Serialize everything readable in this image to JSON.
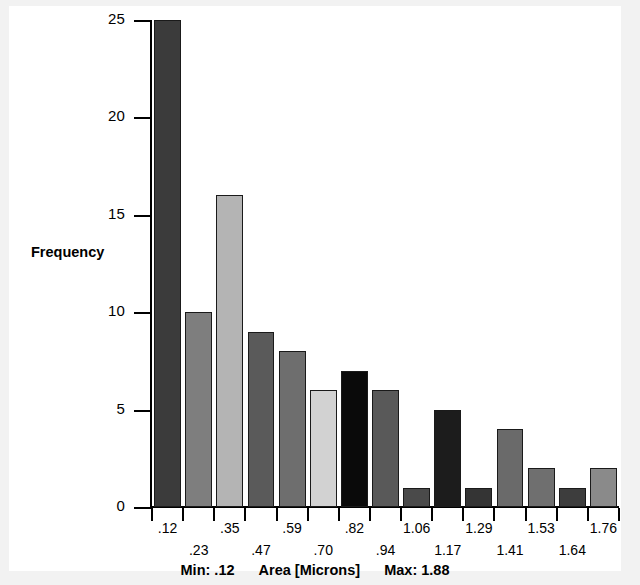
{
  "chart_data": {
    "type": "bar",
    "title": "",
    "subtitle": "",
    "xlabel": "Area [Microns]",
    "ylabel": "Frequency",
    "categories": [
      ".12",
      ".23",
      ".35",
      ".47",
      ".59",
      ".70",
      ".82",
      ".94",
      "1.06",
      "1.17",
      "1.29",
      "1.41",
      "1.53",
      "1.64",
      "1.76"
    ],
    "values": [
      25,
      10,
      16,
      9,
      8,
      6,
      7,
      6,
      1,
      5,
      1,
      4,
      2,
      1,
      2
    ],
    "bar_colors": [
      "#3b3b3b",
      "#7e7e7e",
      "#b4b4b4",
      "#5a5a5a",
      "#6e6e6e",
      "#d2d2d2",
      "#0a0a0a",
      "#595959",
      "#4a4a4a",
      "#1c1c1c",
      "#343434",
      "#6a6a6a",
      "#6f6f6f",
      "#3d3d3d",
      "#8a8a8a"
    ],
    "ylim": [
      0,
      25
    ],
    "yticks": [
      0,
      5,
      10,
      15,
      20,
      25
    ],
    "ytick_labels": [
      "0",
      "5",
      "10",
      "15",
      "20",
      "25"
    ],
    "grid": false,
    "legend": "none",
    "annotations": {
      "min_label": "Min: .12",
      "max_label": "Max: 1.88",
      "axis_title": "Area [Microns]"
    }
  }
}
